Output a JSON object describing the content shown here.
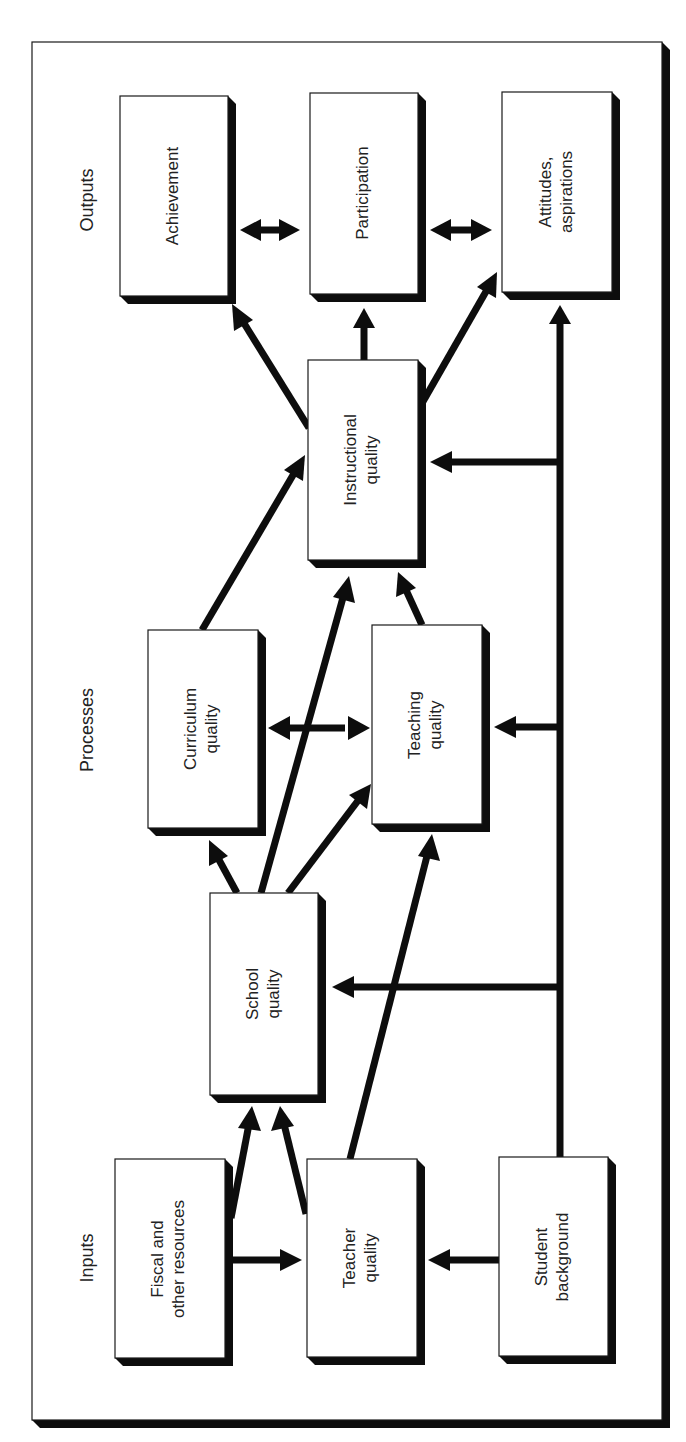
{
  "diagram": {
    "title": "",
    "stages": {
      "outputs": "Outputs",
      "processes": "Processes",
      "inputs": "Inputs"
    },
    "nodes": {
      "achievement": {
        "lines": [
          "Achievement"
        ]
      },
      "participation": {
        "lines": [
          "Participation"
        ]
      },
      "attitudes": {
        "lines": [
          "Attitudes,",
          "aspirations"
        ]
      },
      "instructional": {
        "lines": [
          "Instructional",
          "quality"
        ]
      },
      "curriculum": {
        "lines": [
          "Curriculum",
          "quality"
        ]
      },
      "teaching": {
        "lines": [
          "Teaching",
          "quality"
        ]
      },
      "school": {
        "lines": [
          "School",
          "quality"
        ]
      },
      "fiscal": {
        "lines": [
          "Fiscal and",
          "other resources"
        ]
      },
      "teacher": {
        "lines": [
          "Teacher",
          "quality"
        ]
      },
      "student": {
        "lines": [
          "Student",
          "background"
        ]
      }
    },
    "edges": [
      {
        "from": "Achievement",
        "to": "Participation",
        "type": "bidirectional"
      },
      {
        "from": "Participation",
        "to": "Attitudes, aspirations",
        "type": "bidirectional"
      },
      {
        "from": "Instructional quality",
        "to": "Achievement",
        "type": "directed"
      },
      {
        "from": "Instructional quality",
        "to": "Participation",
        "type": "directed"
      },
      {
        "from": "Instructional quality",
        "to": "Attitudes, aspirations",
        "type": "directed"
      },
      {
        "from": "Curriculum quality",
        "to": "Instructional quality",
        "type": "directed"
      },
      {
        "from": "Teaching quality",
        "to": "Instructional quality",
        "type": "directed"
      },
      {
        "from": "Curriculum quality",
        "to": "Teaching quality",
        "type": "bidirectional"
      },
      {
        "from": "School quality",
        "to": "Curriculum quality",
        "type": "directed"
      },
      {
        "from": "School quality",
        "to": "Instructional quality",
        "type": "directed"
      },
      {
        "from": "School quality",
        "to": "Teaching quality",
        "type": "directed"
      },
      {
        "from": "Fiscal and other resources",
        "to": "School quality",
        "type": "directed"
      },
      {
        "from": "Teacher quality",
        "to": "School quality",
        "type": "directed"
      },
      {
        "from": "Teacher quality",
        "to": "Teaching quality",
        "type": "directed"
      },
      {
        "from": "Fiscal and other resources",
        "to": "Teacher quality",
        "type": "directed"
      },
      {
        "from": "Student background",
        "to": "Teacher quality",
        "type": "directed"
      },
      {
        "from": "Student background",
        "to": "School quality",
        "type": "directed"
      },
      {
        "from": "Student background",
        "to": "Teaching quality",
        "type": "directed"
      },
      {
        "from": "Student background",
        "to": "Instructional quality",
        "type": "directed"
      },
      {
        "from": "Student background",
        "to": "Attitudes, aspirations",
        "type": "directed"
      }
    ],
    "colors": {
      "ink": "#0d0d0d",
      "box_fill": "#ffffff",
      "background": "#ffffff"
    }
  }
}
